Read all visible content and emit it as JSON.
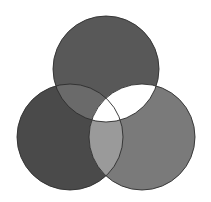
{
  "diagram": {
    "type": "venn-3",
    "canvas": {
      "width": 211,
      "height": 202,
      "background": "#ffffff"
    },
    "stroke": {
      "color": "#2e2e2e",
      "width": 0.9
    },
    "circles": [
      {
        "id": "top",
        "cx": 106,
        "cy": 69,
        "r": 53,
        "fill": "#585858"
      },
      {
        "id": "left",
        "cx": 70,
        "cy": 137,
        "r": 53,
        "fill": "#4a4a4a"
      },
      {
        "id": "right",
        "cx": 142,
        "cy": 137,
        "r": 53,
        "fill": "#7a7a7a"
      }
    ],
    "intersections": [
      {
        "id": "top-left",
        "sets": [
          "top",
          "left"
        ],
        "fill": "#6a6a6a"
      },
      {
        "id": "top-right",
        "sets": [
          "top",
          "right"
        ],
        "fill": "#ffffff"
      },
      {
        "id": "left-right",
        "sets": [
          "left",
          "right"
        ],
        "fill": "#9a9a9a"
      },
      {
        "id": "top-left-right",
        "sets": [
          "top",
          "left",
          "right"
        ],
        "fill": "#ffffff"
      }
    ]
  }
}
